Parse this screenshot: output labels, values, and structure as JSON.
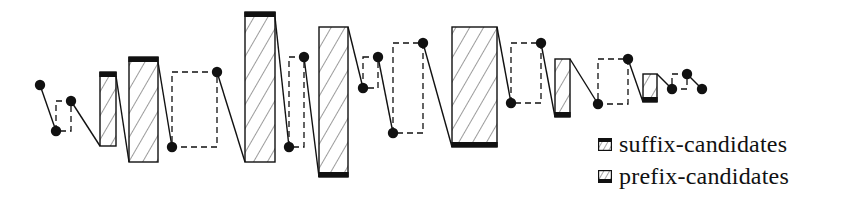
{
  "diagram": {
    "title": "",
    "colors": {
      "stroke": "#111111",
      "background": "#ffffff"
    },
    "dots": [
      {
        "x": 40,
        "y": 85
      },
      {
        "x": 56,
        "y": 131
      },
      {
        "x": 71,
        "y": 101
      },
      {
        "x": 172,
        "y": 147
      },
      {
        "x": 217,
        "y": 72
      },
      {
        "x": 289,
        "y": 147
      },
      {
        "x": 304,
        "y": 57
      },
      {
        "x": 363,
        "y": 88
      },
      {
        "x": 378,
        "y": 57
      },
      {
        "x": 393,
        "y": 133
      },
      {
        "x": 423,
        "y": 43
      },
      {
        "x": 511,
        "y": 103
      },
      {
        "x": 541,
        "y": 43
      },
      {
        "x": 598,
        "y": 104
      },
      {
        "x": 628,
        "y": 59
      },
      {
        "x": 672,
        "y": 89
      },
      {
        "x": 687,
        "y": 74
      },
      {
        "x": 702,
        "y": 89
      }
    ],
    "hatched_boxes": [
      {
        "x": 100,
        "y": 72,
        "w": 16,
        "h": 74,
        "bar": "top",
        "type": "suffix-candidate"
      },
      {
        "x": 129,
        "y": 57,
        "w": 29,
        "h": 105,
        "bar": "top",
        "type": "suffix-candidate"
      },
      {
        "x": 245,
        "y": 12,
        "w": 30,
        "h": 150,
        "bar": "top",
        "type": "suffix-candidate"
      },
      {
        "x": 319,
        "y": 27,
        "w": 29,
        "h": 150,
        "bar": "bottom",
        "type": "prefix-candidate"
      },
      {
        "x": 452,
        "y": 27,
        "w": 45,
        "h": 120,
        "bar": "bottom",
        "type": "prefix-candidate"
      },
      {
        "x": 555,
        "y": 59,
        "w": 15,
        "h": 58,
        "bar": "bottom",
        "type": "prefix-candidate"
      },
      {
        "x": 643,
        "y": 74,
        "w": 14,
        "h": 28,
        "bar": "bottom",
        "type": "prefix-candidate"
      }
    ],
    "dashed_boxes": [
      {
        "x": 56,
        "y": 101,
        "w": 15,
        "h": 30
      },
      {
        "x": 172,
        "y": 72,
        "w": 45,
        "h": 75
      },
      {
        "x": 289,
        "y": 57,
        "w": 15,
        "h": 90
      },
      {
        "x": 363,
        "y": 57,
        "w": 15,
        "h": 31
      },
      {
        "x": 393,
        "y": 43,
        "w": 30,
        "h": 90
      },
      {
        "x": 511,
        "y": 43,
        "w": 30,
        "h": 60
      },
      {
        "x": 598,
        "y": 59,
        "w": 30,
        "h": 45
      },
      {
        "x": 672,
        "y": 74,
        "w": 15,
        "h": 15
      }
    ],
    "path": [
      [
        40,
        85
      ],
      [
        56,
        131
      ],
      [
        71,
        101
      ],
      [
        100,
        146
      ],
      [
        116,
        76
      ],
      [
        129,
        162
      ],
      [
        158,
        62
      ],
      [
        172,
        147
      ],
      [
        217,
        72
      ],
      [
        245,
        162
      ],
      [
        275,
        17
      ],
      [
        289,
        147
      ],
      [
        304,
        57
      ],
      [
        319,
        177
      ],
      [
        348,
        27
      ],
      [
        363,
        88
      ],
      [
        378,
        57
      ],
      [
        393,
        133
      ],
      [
        423,
        43
      ],
      [
        452,
        147
      ],
      [
        497,
        27
      ],
      [
        511,
        103
      ],
      [
        541,
        43
      ],
      [
        555,
        117
      ],
      [
        570,
        59
      ],
      [
        598,
        104
      ],
      [
        628,
        59
      ],
      [
        643,
        102
      ],
      [
        657,
        74
      ],
      [
        672,
        89
      ],
      [
        687,
        74
      ],
      [
        702,
        89
      ]
    ],
    "solid_segments": [
      [
        [
          40,
          85
        ],
        [
          56,
          131
        ]
      ],
      [
        [
          71,
          101
        ],
        [
          100,
          146
        ]
      ],
      [
        [
          116,
          76
        ],
        [
          129,
          162
        ]
      ],
      [
        [
          158,
          62
        ],
        [
          172,
          147
        ]
      ],
      [
        [
          217,
          72
        ],
        [
          245,
          162
        ]
      ],
      [
        [
          275,
          17
        ],
        [
          289,
          147
        ]
      ],
      [
        [
          304,
          57
        ],
        [
          319,
          177
        ]
      ],
      [
        [
          348,
          27
        ],
        [
          363,
          88
        ]
      ],
      [
        [
          378,
          57
        ],
        [
          393,
          133
        ]
      ],
      [
        [
          423,
          43
        ],
        [
          452,
          147
        ]
      ],
      [
        [
          497,
          27
        ],
        [
          511,
          103
        ]
      ],
      [
        [
          541,
          43
        ],
        [
          555,
          117
        ]
      ],
      [
        [
          570,
          59
        ],
        [
          598,
          104
        ]
      ],
      [
        [
          628,
          59
        ],
        [
          643,
          102
        ]
      ],
      [
        [
          657,
          74
        ],
        [
          672,
          89
        ]
      ],
      [
        [
          687,
          74
        ],
        [
          702,
          89
        ]
      ]
    ]
  },
  "legend": {
    "items": [
      {
        "label": "suffix-candidates",
        "icon": "hatched-box-top-bar-icon"
      },
      {
        "label": "prefix-candidates",
        "icon": "hatched-box-bottom-bar-icon"
      }
    ]
  }
}
